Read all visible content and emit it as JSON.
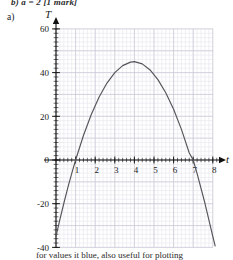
{
  "page": {
    "top_text": "b)   a = 2 [1 mark]",
    "part_label": "a)",
    "bottom_text": "for values it blue, also useful for plotting"
  },
  "chart_data": {
    "type": "line",
    "title": "",
    "xlabel": "t",
    "ylabel": "T",
    "xlim": [
      0,
      8.6
    ],
    "ylim": [
      -40,
      60
    ],
    "x_ticks": [
      1,
      2,
      3,
      4,
      5,
      6,
      7,
      8
    ],
    "x_tick_labels": [
      "1",
      "2",
      "3",
      "4",
      "5",
      "6",
      "7",
      "8"
    ],
    "y_ticks": [
      -40,
      -20,
      0,
      20,
      40,
      60
    ],
    "y_tick_labels": [
      "-40",
      "-20",
      "0",
      "20",
      "40",
      "60"
    ],
    "grid": true,
    "grid_minor_step_x": 0.2,
    "grid_minor_step_y": 2,
    "grid_major_step_x": 1,
    "grid_major_step_y": 10,
    "legend": null,
    "curve_color": "#55555a",
    "grid_minor_color": "#e6e6ee",
    "grid_major_color": "#c9c9d6",
    "axis_color": "#111111",
    "series": [
      {
        "name": "T(t)",
        "equation": "T = -5(t-1)(t-7)",
        "vertex": [
          4,
          45
        ],
        "roots": [
          1,
          7
        ],
        "points": [
          [
            0.0,
            -35.0
          ],
          [
            0.2,
            -27.2
          ],
          [
            0.4,
            -19.8
          ],
          [
            0.6,
            -12.8
          ],
          [
            0.8,
            -6.2
          ],
          [
            1.0,
            0.0
          ],
          [
            1.4,
            11.2
          ],
          [
            1.8,
            20.8
          ],
          [
            2.2,
            28.8
          ],
          [
            2.6,
            35.2
          ],
          [
            3.0,
            40.0
          ],
          [
            3.4,
            43.2
          ],
          [
            3.8,
            44.8
          ],
          [
            4.0,
            45.0
          ],
          [
            4.4,
            44.0
          ],
          [
            4.8,
            41.2
          ],
          [
            5.2,
            36.8
          ],
          [
            5.6,
            30.8
          ],
          [
            6.0,
            23.2
          ],
          [
            6.4,
            14.0
          ],
          [
            6.8,
            3.2
          ],
          [
            7.0,
            0.0
          ],
          [
            7.2,
            -6.2
          ],
          [
            7.6,
            -19.8
          ],
          [
            8.0,
            -35.0
          ],
          [
            8.12,
            -39.3
          ]
        ]
      }
    ]
  }
}
